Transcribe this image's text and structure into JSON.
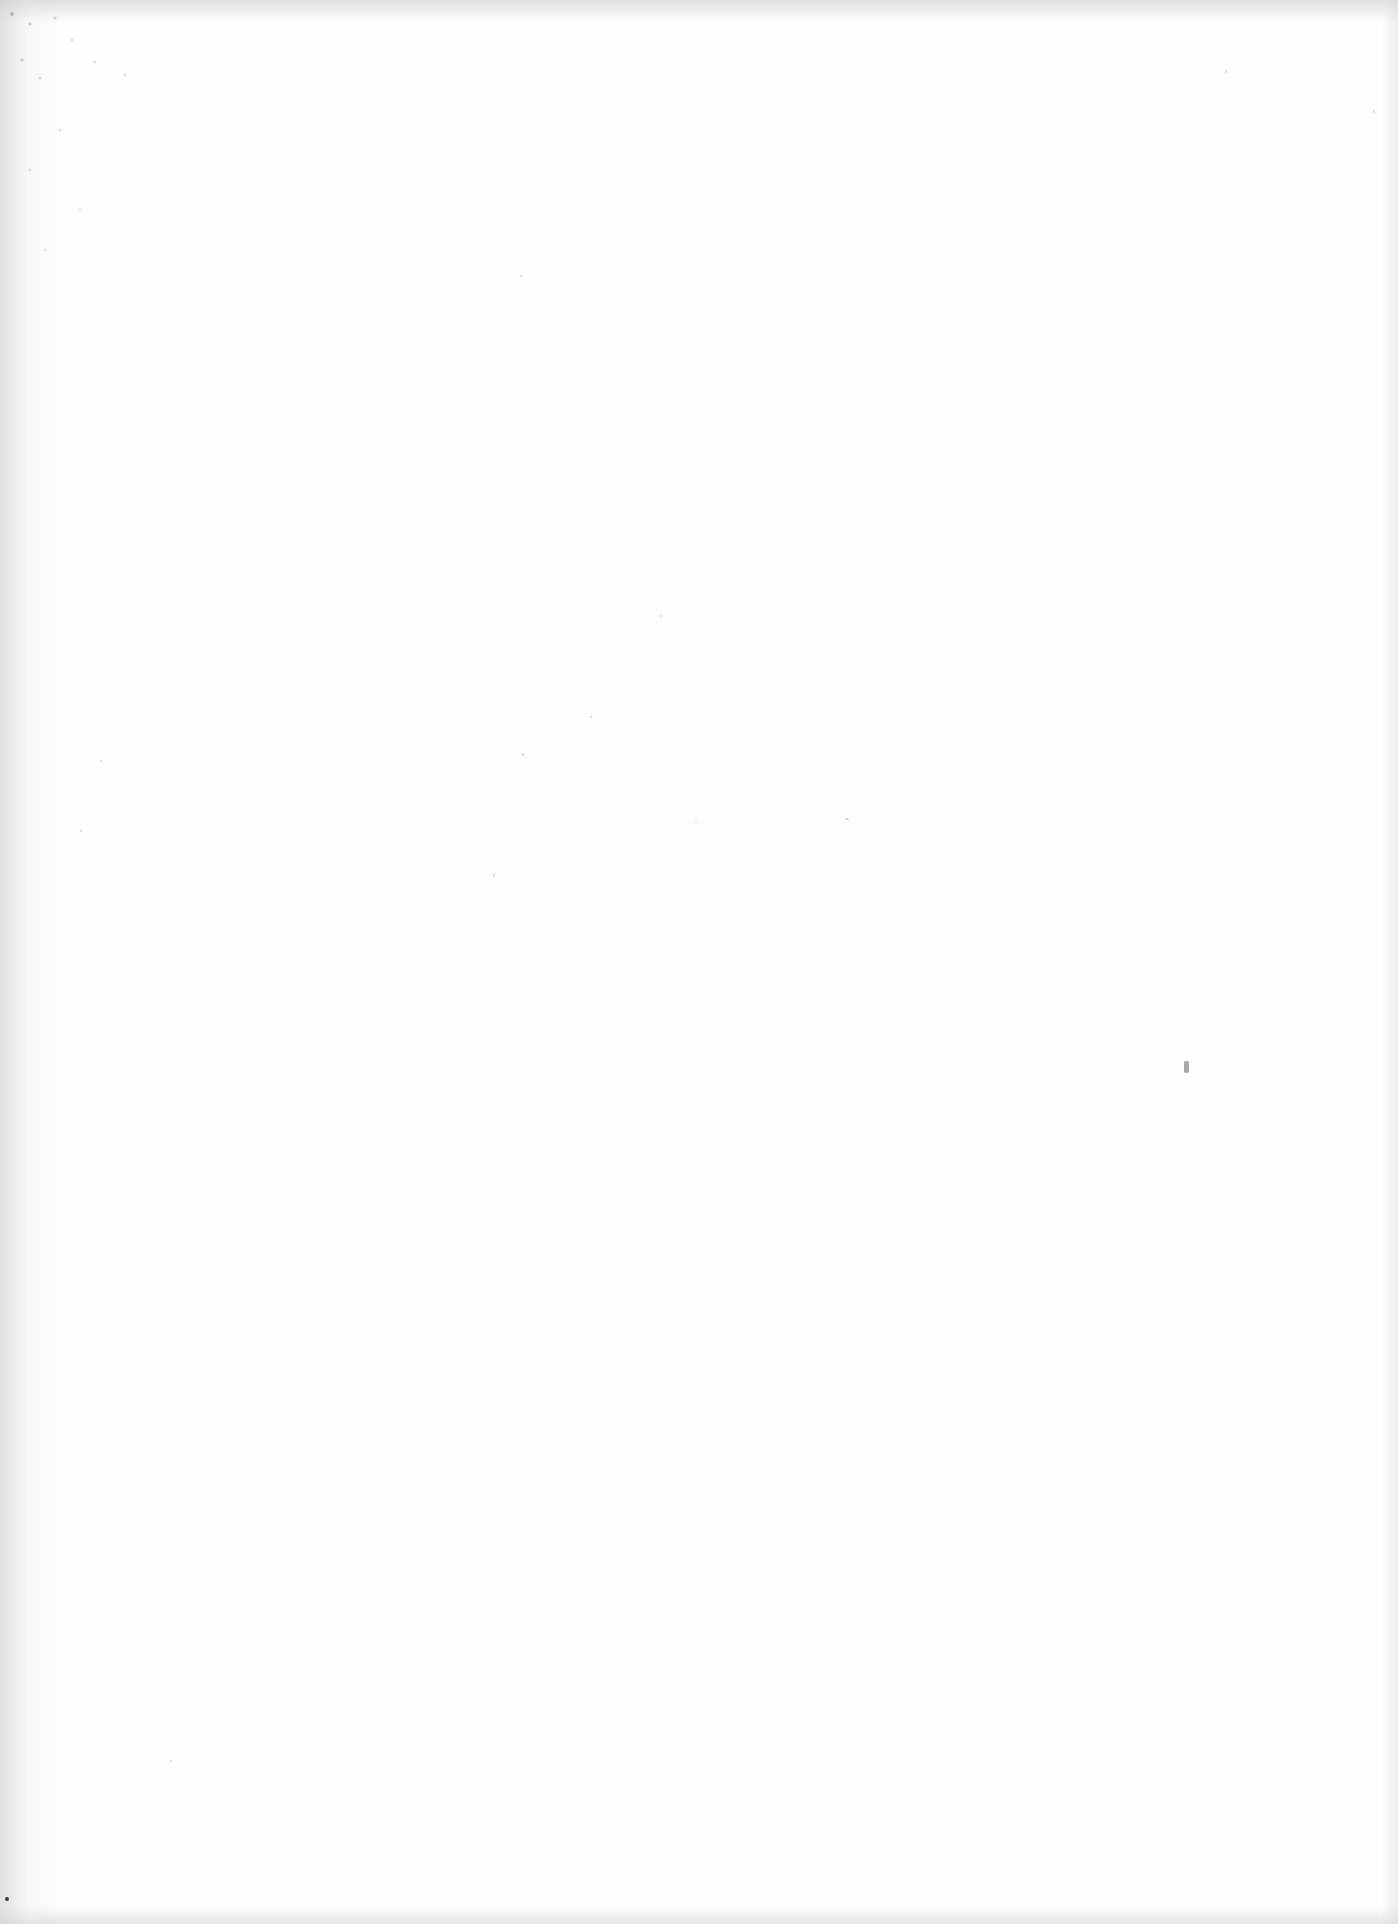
{
  "page": {
    "type": "blank-scanned-page",
    "background_color": "#fefefe",
    "edge_shadow_color": "#c8c8c8",
    "text_content": []
  }
}
